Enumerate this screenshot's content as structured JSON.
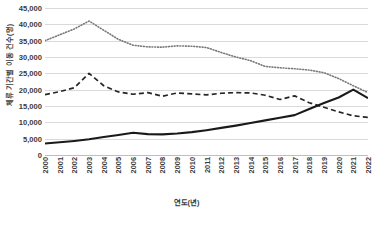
{
  "chart_data": {
    "type": "line",
    "title": "",
    "xlabel": "연도(년)",
    "ylabel": "체류 기간별 이동 건수(명)",
    "grid": true,
    "legend": "none",
    "ylim": [
      0,
      45000
    ],
    "ytick_step": 5000,
    "ytick_labels": [
      "45,000",
      "40,000",
      "35,000",
      "30,000",
      "25,000",
      "20,000",
      "15,000",
      "10,000",
      "5,000",
      "0"
    ],
    "ytick_values": [
      45000,
      40000,
      35000,
      30000,
      25000,
      20000,
      15000,
      10000,
      5000,
      0
    ],
    "categories": [
      "2000",
      "2001",
      "2002",
      "2003",
      "2004",
      "2005",
      "2006",
      "2007",
      "2008",
      "2009",
      "2010",
      "2011",
      "2012",
      "2013",
      "2014",
      "2015",
      "2016",
      "2017",
      "2018",
      "2019",
      "2020",
      "2021",
      "2022"
    ],
    "series": [
      {
        "name": "dotted-series",
        "style": "dotted",
        "color": "#7a7a7a",
        "values": [
          35000,
          36800,
          38600,
          41000,
          38200,
          35400,
          33600,
          33100,
          33000,
          33400,
          33300,
          32900,
          31400,
          30000,
          28900,
          27100,
          26700,
          26400,
          26000,
          25200,
          23400,
          21200,
          19100
        ]
      },
      {
        "name": "dashed-series",
        "style": "dashed",
        "color": "#262626",
        "values": [
          18500,
          19400,
          20600,
          25000,
          21200,
          19300,
          18600,
          19100,
          18000,
          19000,
          18700,
          18400,
          18900,
          19100,
          19000,
          18300,
          17000,
          18100,
          16000,
          14600,
          13200,
          12000,
          11500
        ]
      },
      {
        "name": "solid-series",
        "style": "solid",
        "color": "#1a1a1a",
        "values": [
          3500,
          3900,
          4300,
          4800,
          5500,
          6100,
          6800,
          6400,
          6300,
          6600,
          7000,
          7600,
          8300,
          9000,
          9800,
          10600,
          11400,
          12200,
          14100,
          15900,
          17600,
          20000,
          17400
        ]
      }
    ]
  },
  "axes": {
    "y_title": "체류 기간별 이동 건수(명)",
    "x_title": "연도(년)"
  }
}
